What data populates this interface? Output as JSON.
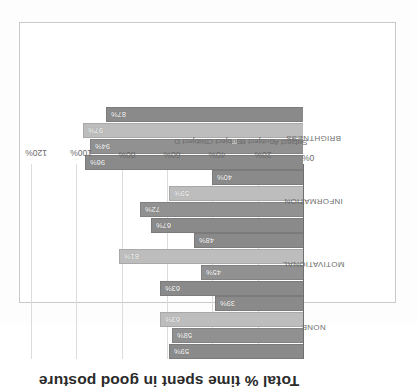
{
  "chart_data": {
    "type": "bar",
    "title": "Total % time spent in good posture",
    "xlabel": "",
    "ylabel": "Total % time spent in good posture",
    "ylim": [
      0,
      120
    ],
    "yticks": [
      "0%",
      "20%",
      "40%",
      "60%",
      "80%",
      "100%",
      "120%"
    ],
    "ytick_values": [
      0,
      20,
      40,
      60,
      80,
      100,
      120
    ],
    "grid": true,
    "legend_position": "right",
    "categories": [
      "NONE",
      "MOTIVATIONAL",
      "INFORMATION",
      "BRIGHTNESS"
    ],
    "series": [
      {
        "name": "Subject A",
        "color": "#8a8a8a",
        "values": [
          59,
          63,
          67,
          96
        ],
        "labels": [
          "59%",
          "63%",
          "67%",
          "96%"
        ]
      },
      {
        "name": "Subject B",
        "color": "#919191",
        "values": [
          58,
          45,
          72,
          94
        ],
        "labels": [
          "58%",
          "45%",
          "72%",
          "94%"
        ]
      },
      {
        "name": "Subject C",
        "color": "#bdbdbd",
        "values": [
          63,
          81,
          59,
          97
        ],
        "labels": [
          "63%",
          "81%",
          "59%",
          "97%"
        ]
      },
      {
        "name": "Subject D",
        "color": "#8a8a8a",
        "values": [
          39,
          48,
          40,
          87
        ],
        "labels": [
          "39%",
          "48%",
          "40%",
          "87%"
        ]
      }
    ]
  },
  "legend": {
    "items": [
      {
        "label": "Subject A",
        "color": "#8a8a8a"
      },
      {
        "label": "Subject B",
        "color": "#919191"
      },
      {
        "label": "Subject C",
        "color": "#bdbdbd"
      },
      {
        "label": "Subject D",
        "color": "#8a8a8a"
      }
    ]
  }
}
